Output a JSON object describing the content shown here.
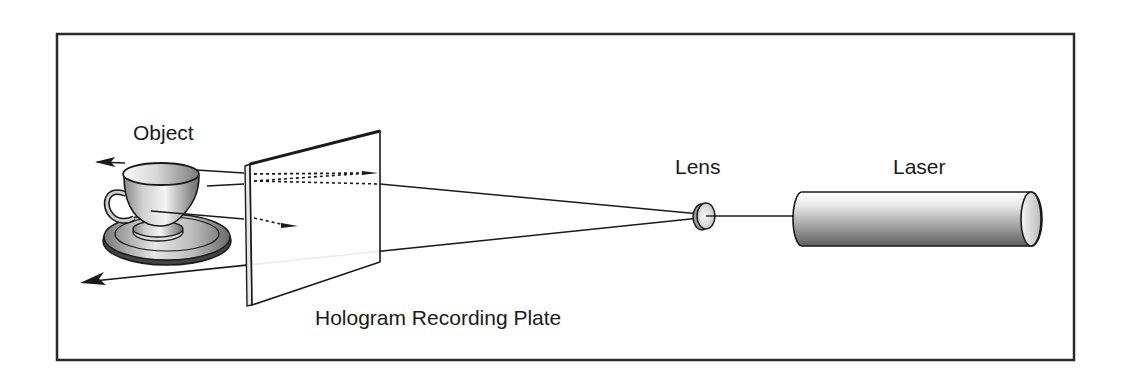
{
  "diagram": {
    "type": "optical-setup",
    "labels": {
      "object": "Object",
      "lens": "Lens",
      "laser": "Laser",
      "plate": "Hologram Recording Plate"
    },
    "components": [
      {
        "id": "object",
        "label": "Object",
        "depicts": "teacup on saucer"
      },
      {
        "id": "plate",
        "label": "Hologram Recording Plate",
        "depicts": "tilted glass plate"
      },
      {
        "id": "lens",
        "label": "Lens",
        "depicts": "diverging lens"
      },
      {
        "id": "laser",
        "label": "Laser",
        "depicts": "cylindrical laser tube"
      }
    ],
    "beams": [
      {
        "from": "laser",
        "to": "lens",
        "style": "solid"
      },
      {
        "from": "lens",
        "to": "plate",
        "style": "solid",
        "note": "expanded reference beam, upper ray"
      },
      {
        "from": "lens",
        "to": "left-edge",
        "style": "solid-arrow",
        "note": "expanded beam, lower ray passing plate"
      },
      {
        "from": "object",
        "to": "plate",
        "style": "solid then dotted",
        "note": "object beams scattered onto plate"
      }
    ],
    "colors": {
      "stroke": "#1a1a1a",
      "frame": "#2a2a2a",
      "background": "#ffffff",
      "shade_dark": "#6e6e6e",
      "shade_light": "#f2f2f2"
    }
  }
}
